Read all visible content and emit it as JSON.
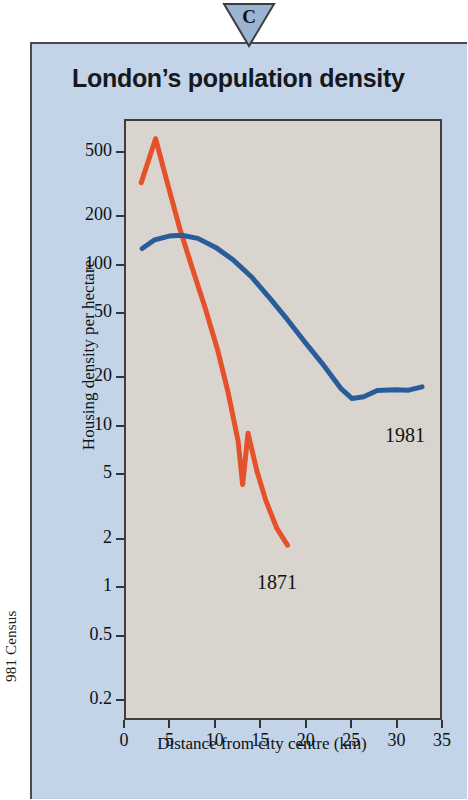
{
  "margin": {
    "source_note": "981 Census"
  },
  "badge": {
    "letter": "C",
    "shape": "triangle-down-icon",
    "fill": "#9ab4d2"
  },
  "panel": {
    "background": "#c3d4e8",
    "title": "London’s population density"
  },
  "chart_data": {
    "type": "line",
    "title": "London’s population density",
    "xlabel": "Distance from city centre (km)",
    "ylabel": "Housing density per hectare",
    "yscale": "log",
    "xlim": [
      0,
      35
    ],
    "ylim": [
      0.15,
      800
    ],
    "grid": false,
    "legend": "inline-annotations",
    "plot_background": "#d9d5ce",
    "xticks": [
      0,
      5,
      10,
      15,
      20,
      25,
      30,
      35
    ],
    "xtick_labels": [
      "0",
      "5",
      "10",
      "15",
      "20",
      "25",
      "30",
      "35"
    ],
    "yticks": [
      500,
      200,
      100,
      50,
      20,
      10,
      5,
      2,
      1,
      0.5,
      0.2
    ],
    "ytick_labels": [
      "500",
      "200",
      "100",
      "50",
      "20",
      "10",
      "5",
      "2",
      "1",
      "0.5",
      "0.2"
    ],
    "series": [
      {
        "name": "1871",
        "color": "#e4512a",
        "label_position": "below-line-end",
        "points": [
          [
            1.7,
            330
          ],
          [
            3.3,
            620
          ],
          [
            4.6,
            330
          ],
          [
            6.0,
            170
          ],
          [
            7.4,
            96
          ],
          [
            8.8,
            55
          ],
          [
            10.2,
            30
          ],
          [
            11.4,
            16
          ],
          [
            12.5,
            8.0
          ],
          [
            13.0,
            4.3
          ],
          [
            13.6,
            9.0
          ],
          [
            14.6,
            5.2
          ],
          [
            15.6,
            3.4
          ],
          [
            16.8,
            2.3
          ],
          [
            18.0,
            1.8
          ]
        ]
      },
      {
        "name": "1981",
        "color": "#2a5c99",
        "label_position": "below-line-end",
        "points": [
          [
            1.8,
            128
          ],
          [
            3.2,
            145
          ],
          [
            4.8,
            153
          ],
          [
            6.2,
            155
          ],
          [
            8.0,
            148
          ],
          [
            10.0,
            130
          ],
          [
            12.0,
            108
          ],
          [
            14.0,
            85
          ],
          [
            16.0,
            63
          ],
          [
            18.0,
            46
          ],
          [
            20.0,
            33
          ],
          [
            22.0,
            24
          ],
          [
            24.0,
            17
          ],
          [
            25.2,
            14.8
          ],
          [
            26.5,
            15.2
          ],
          [
            28.0,
            16.6
          ],
          [
            30.0,
            16.8
          ],
          [
            31.5,
            16.7
          ],
          [
            33.0,
            17.5
          ]
        ]
      }
    ]
  }
}
